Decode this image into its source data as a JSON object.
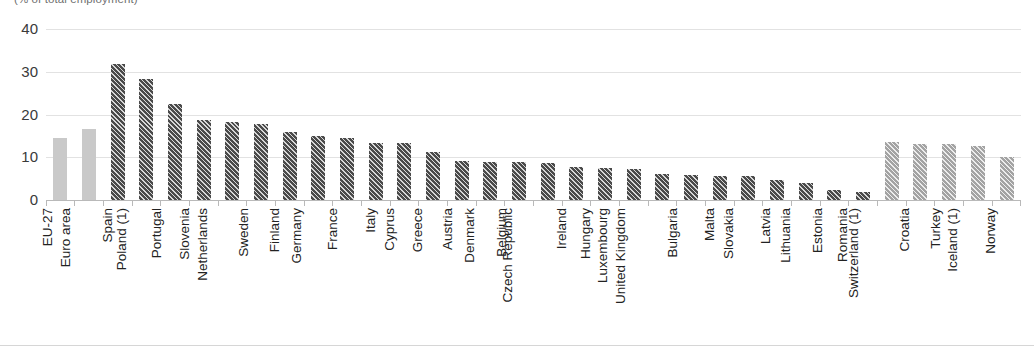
{
  "subtitle": "(% of total employment)",
  "colors": {
    "aggregate": "#c9c9c9",
    "member_state": "#4a4a4a",
    "non_member": "#a3a3a3",
    "gridline": "#e2e2e2",
    "axis": "#b9b9b9"
  },
  "chart_data": {
    "type": "bar",
    "title": "",
    "subtitle": "(% of total employment)",
    "xlabel": "",
    "ylabel": "",
    "ylim": [
      0,
      40
    ],
    "yticks": [
      0,
      10,
      20,
      30,
      40
    ],
    "ytick_labels": [
      "0",
      "10",
      "20",
      "30",
      "40"
    ],
    "grid": true,
    "legend": "none",
    "categories": [
      "EU-27",
      "Euro area",
      "Spain",
      "Poland (1)",
      "Portugal",
      "Slovenia",
      "Netherlands",
      "Sweden",
      "Finland",
      "Germany",
      "France",
      "Italy",
      "Cyprus",
      "Greece",
      "Austria",
      "Denmark",
      "Belgium",
      "Czech Republic",
      "Ireland",
      "Hungary",
      "Luxembourg",
      "United Kingdom",
      "Bulgaria",
      "Malta",
      "Slovakia",
      "Latvia",
      "Lithuania",
      "Estonia",
      "Romania",
      "Switzerland (1)",
      "Croatia",
      "Turkey",
      "Iceland (1)",
      "Norway"
    ],
    "values": [
      14.4,
      16.6,
      31.7,
      28.2,
      22.4,
      18.7,
      18.3,
      17.7,
      16.0,
      14.9,
      14.6,
      13.4,
      13.3,
      11.2,
      9.1,
      8.9,
      8.8,
      8.7,
      7.7,
      7.6,
      7.2,
      6.2,
      5.9,
      5.7,
      5.6,
      4.6,
      3.9,
      2.3,
      1.8,
      13.5,
      13.1,
      13.0,
      12.7,
      10.0
    ],
    "groups": [
      "aggregate",
      "aggregate",
      "member_state",
      "member_state",
      "member_state",
      "member_state",
      "member_state",
      "member_state",
      "member_state",
      "member_state",
      "member_state",
      "member_state",
      "member_state",
      "member_state",
      "member_state",
      "member_state",
      "member_state",
      "member_state",
      "member_state",
      "member_state",
      "member_state",
      "member_state",
      "member_state",
      "member_state",
      "member_state",
      "member_state",
      "member_state",
      "member_state",
      "member_state",
      "non_member",
      "non_member",
      "non_member",
      "non_member",
      "non_member"
    ]
  }
}
